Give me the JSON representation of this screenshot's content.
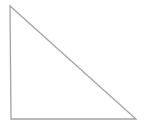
{
  "diagram": {
    "shape": "right-triangle",
    "stroke_color": "#a3a3a3",
    "fill_color": "#ffffff",
    "stroke_width": 1.3,
    "vertices": [
      {
        "name": "top-left",
        "x": 10,
        "y": 6
      },
      {
        "name": "bottom-left",
        "x": 11,
        "y": 119
      },
      {
        "name": "bottom-right",
        "x": 136,
        "y": 119
      }
    ]
  }
}
